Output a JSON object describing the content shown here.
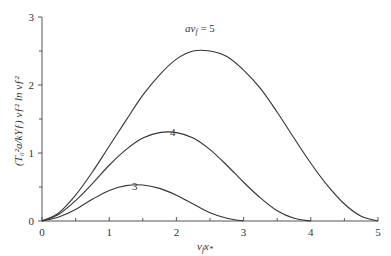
{
  "chart_data": {
    "type": "line",
    "title": "",
    "xlabel": "v_f x_*",
    "ylabel": "(T_0^2 a/kY_f) v_f^2 ln v_f^2",
    "xlim": [
      0,
      5
    ],
    "ylim": [
      0,
      3
    ],
    "xticks": [
      0,
      1,
      2,
      3,
      4,
      5
    ],
    "yticks": [
      0,
      1,
      2,
      3
    ],
    "grid": false,
    "legend": "inline curve labels",
    "series": [
      {
        "name": "av_f = 5",
        "label": "av_f = 5",
        "x": [
          0,
          0.25,
          0.5,
          0.75,
          1.0,
          1.25,
          1.5,
          1.75,
          2.0,
          2.25,
          2.5,
          2.75,
          3.0,
          3.25,
          3.5,
          3.75,
          4.0,
          4.25,
          4.5,
          4.75,
          5.0
        ],
        "y": [
          0,
          0.12,
          0.38,
          0.72,
          1.1,
          1.48,
          1.85,
          2.15,
          2.38,
          2.5,
          2.5,
          2.42,
          2.22,
          1.95,
          1.6,
          1.22,
          0.85,
          0.52,
          0.25,
          0.07,
          0
        ]
      },
      {
        "name": "4",
        "label": "4",
        "x": [
          0,
          0.25,
          0.5,
          0.75,
          1.0,
          1.25,
          1.5,
          1.75,
          2.0,
          2.25,
          2.5,
          2.75,
          3.0,
          3.25,
          3.5,
          3.75,
          4.0
        ],
        "y": [
          0,
          0.1,
          0.3,
          0.55,
          0.82,
          1.05,
          1.22,
          1.3,
          1.3,
          1.22,
          1.05,
          0.82,
          0.57,
          0.34,
          0.15,
          0.04,
          0
        ]
      },
      {
        "name": "3",
        "label": "3",
        "x": [
          0,
          0.25,
          0.5,
          0.75,
          1.0,
          1.25,
          1.5,
          1.75,
          2.0,
          2.25,
          2.5,
          2.75,
          3.0
        ],
        "y": [
          0,
          0.06,
          0.17,
          0.32,
          0.45,
          0.52,
          0.53,
          0.48,
          0.38,
          0.25,
          0.12,
          0.04,
          0
        ]
      }
    ]
  },
  "labels": {
    "curve5": "av",
    "curve5_sub": "f",
    "curve5_eq": " = 5",
    "curve4": "4",
    "curve3": "3",
    "xlabel_main": "v",
    "xlabel_sub": "f",
    "xlabel_x": "x",
    "xlabel_star": "*",
    "ylabel": "(T₀²a/kYƒ) vƒ² ln vƒ²"
  }
}
